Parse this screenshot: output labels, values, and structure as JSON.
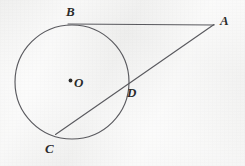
{
  "figure": {
    "type": "geometry-diagram",
    "background_color": "#f4f4f3",
    "stroke_color": "#55555a",
    "label_color": "#2b2b2b"
  },
  "labels": {
    "A": "A",
    "B": "B",
    "C": "C",
    "D": "D",
    "O": "O"
  },
  "geometry": {
    "circle": {
      "cx": 72,
      "cy": 82,
      "r": 57
    },
    "center_dot": {
      "cx": 70.5,
      "cy": 80.5,
      "r": 1.8
    },
    "points": {
      "A": {
        "x": 214,
        "y": 24.5
      },
      "B": {
        "x": 69.5,
        "y": 25
      },
      "C": {
        "x": 57,
        "y": 133
      },
      "D": {
        "x": 123,
        "y": 87
      },
      "O": {
        "x": 72,
        "y": 82
      }
    },
    "segments": [
      {
        "name": "tangent-BA",
        "x1": 68,
        "y1": 24,
        "x2": 214,
        "y2": 25
      },
      {
        "name": "secant-CA",
        "x1": 55.5,
        "y1": 134.5,
        "x2": 214,
        "y2": 24.5
      }
    ]
  },
  "label_positions": {
    "A": {
      "left": 220,
      "top": 14
    },
    "B": {
      "left": 66,
      "top": 5
    },
    "C": {
      "left": 45,
      "top": 142
    },
    "D": {
      "left": 127,
      "top": 86
    },
    "O": {
      "left": 74,
      "top": 76
    }
  }
}
